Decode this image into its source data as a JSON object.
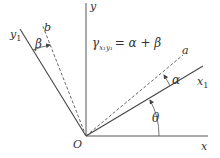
{
  "diagram": {
    "origin_label": "O",
    "axes": {
      "x": "x",
      "y": "y",
      "x1": "x",
      "x1_sub": "1",
      "y1": "y",
      "y1_sub": "1",
      "a": "a",
      "b": "b"
    },
    "angles": {
      "theta": "θ",
      "alpha": "α",
      "beta": "β"
    },
    "equation": {
      "lhs": "γ",
      "lhs_sub": "x₁y₁",
      "rhs": "= α + β"
    },
    "colors": {
      "line": "#444444",
      "text": "#333333"
    }
  }
}
